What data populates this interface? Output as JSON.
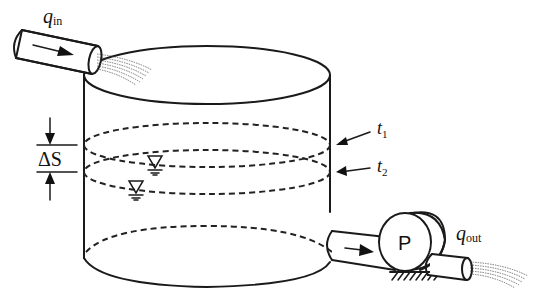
{
  "diagram": {
    "labels": {
      "inflow_main": "q",
      "inflow_sub": "in",
      "outflow_main": "q",
      "outflow_sub": "out",
      "delta_s": "ΔS",
      "time1_main": "t",
      "time1_sub": "1",
      "time2_main": "t",
      "time2_sub": "2",
      "pump": "P"
    },
    "components": [
      "inflow-pipe",
      "tank",
      "water-level-t1",
      "water-level-t2",
      "outflow-pipe",
      "pump",
      "pump-base",
      "discharge-pipe"
    ],
    "colors": {
      "line": "#1a1a1a",
      "background": "#ffffff"
    }
  }
}
